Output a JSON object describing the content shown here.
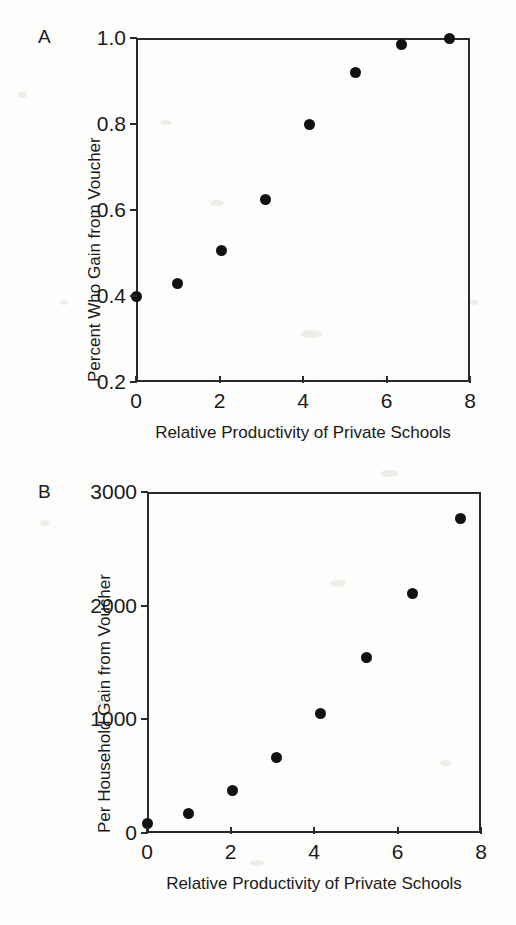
{
  "figure": {
    "background": "#fdfdfc",
    "marker_color": "#111111",
    "axis_color": "#2a2a2a"
  },
  "panels": [
    {
      "letter": "A",
      "name": "panel-a",
      "chart_index": 0
    },
    {
      "letter": "B",
      "name": "panel-b",
      "chart_index": 1
    }
  ],
  "chart_data": [
    {
      "type": "scatter",
      "panel": "A",
      "title": "",
      "xlabel": "Relative Productivity of Private Schools",
      "ylabel": "Percent Who Gain from Voucher",
      "xlim": [
        0,
        8
      ],
      "ylim": [
        0.2,
        1.0
      ],
      "xticks": [
        0,
        2,
        4,
        6,
        8
      ],
      "xticklabels": [
        "0",
        "2",
        "4",
        "6",
        "8"
      ],
      "yticks": [
        0.2,
        0.4,
        0.6,
        0.8,
        1.0
      ],
      "yticklabels": [
        "0.2",
        "0.4",
        "0.6",
        "0.8",
        "1.0"
      ],
      "grid": false,
      "legend": null,
      "series": [
        {
          "name": "Percent who gain from voucher",
          "x": [
            0.0,
            1.0,
            2.05,
            3.1,
            4.15,
            5.25,
            6.35,
            7.5
          ],
          "y": [
            0.4,
            0.43,
            0.505,
            0.625,
            0.8,
            0.92,
            0.985,
            0.998
          ]
        }
      ]
    },
    {
      "type": "scatter",
      "panel": "B",
      "title": "",
      "xlabel": "Relative Productivity of Private Schools",
      "ylabel": "Per Household Gain from Voucher",
      "xlim": [
        0,
        8
      ],
      "ylim": [
        0,
        3000
      ],
      "xticks": [
        0,
        2,
        4,
        6,
        8
      ],
      "xticklabels": [
        "0",
        "2",
        "4",
        "6",
        "8"
      ],
      "yticks": [
        0,
        1000,
        2000,
        3000
      ],
      "yticklabels": [
        "0",
        "1000",
        "2000",
        "3000"
      ],
      "grid": false,
      "legend": null,
      "series": [
        {
          "name": "Per household gain from voucher",
          "x": [
            0.0,
            1.0,
            2.05,
            3.1,
            4.15,
            5.25,
            6.35,
            7.5
          ],
          "y": [
            80,
            175,
            370,
            660,
            1050,
            1540,
            2110,
            2770
          ]
        }
      ]
    }
  ]
}
